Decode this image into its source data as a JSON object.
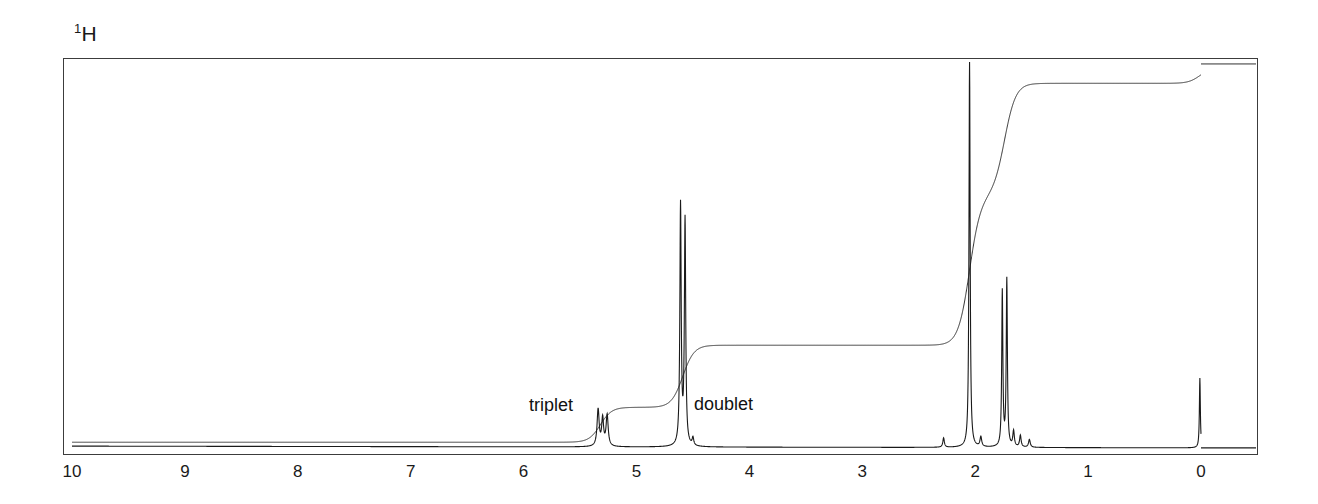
{
  "figure": {
    "nucleus_superscript": "1",
    "nucleus_symbol": "H"
  },
  "annotations": [
    {
      "name": "triplet",
      "label": "triplet",
      "ppm": 5.3
    },
    {
      "name": "doublet",
      "label": "doublet",
      "ppm": 4.6
    }
  ],
  "axis": {
    "label": "",
    "tick_labels": [
      "10",
      "9",
      "8",
      "7",
      "6",
      "5",
      "4",
      "3",
      "2",
      "1",
      "0"
    ],
    "min": 0,
    "max": 10,
    "direction": "reversed"
  },
  "colors": {
    "trace": "#1a1a1a",
    "frame": "#3c3c3c",
    "background": "#ffffff",
    "text": "#1a1a1a"
  },
  "chart_data": {
    "type": "line",
    "title": "1H",
    "xlabel": "",
    "ylabel": "",
    "xlim": [
      10,
      0
    ],
    "ylim": [
      0,
      100
    ],
    "grid": false,
    "legend": "none",
    "tick_values": [
      10,
      9,
      8,
      7,
      6,
      5,
      4,
      3,
      2,
      1,
      0
    ],
    "tick_labels": [
      "10",
      "9",
      "8",
      "7",
      "6",
      "5",
      "4",
      "3",
      "2",
      "1",
      "0"
    ],
    "series": [
      {
        "name": "spectrum",
        "type": "peaks",
        "peaks": [
          {
            "ppm": 5.34,
            "height": 9.5,
            "width": 0.022,
            "multiplicity": "triplet",
            "label": "triplet"
          },
          {
            "ppm": 5.3,
            "height": 7.0,
            "width": 0.02,
            "multiplicity": "triplet"
          },
          {
            "ppm": 5.26,
            "height": 8.0,
            "width": 0.022,
            "multiplicity": "triplet"
          },
          {
            "ppm": 4.61,
            "height": 62.0,
            "width": 0.014,
            "multiplicity": "doublet",
            "label": "doublet"
          },
          {
            "ppm": 4.57,
            "height": 58.0,
            "width": 0.014,
            "multiplicity": "doublet"
          },
          {
            "ppm": 4.5,
            "height": 2.0,
            "width": 0.016
          },
          {
            "ppm": 2.28,
            "height": 2.4,
            "width": 0.016
          },
          {
            "ppm": 2.05,
            "height": 100.0,
            "width": 0.012,
            "multiplicity": "singlet"
          },
          {
            "ppm": 1.95,
            "height": 2.5,
            "width": 0.018
          },
          {
            "ppm": 1.76,
            "height": 40.0,
            "width": 0.012
          },
          {
            "ppm": 1.72,
            "height": 43.0,
            "width": 0.012
          },
          {
            "ppm": 1.66,
            "height": 4.0,
            "width": 0.016
          },
          {
            "ppm": 1.6,
            "height": 3.0,
            "width": 0.016
          },
          {
            "ppm": 1.52,
            "height": 2.0,
            "width": 0.018
          },
          {
            "ppm": 0.01,
            "height": 18.0,
            "width": 0.01,
            "multiplicity": "singlet"
          }
        ]
      },
      {
        "name": "integral",
        "type": "step-trace",
        "steps": [
          {
            "ppm": 10.0,
            "level": 2.0
          },
          {
            "ppm": 5.32,
            "level": 2.0,
            "rise_to": 11.0
          },
          {
            "ppm": 4.59,
            "level": 11.0,
            "rise_to": 27.0
          },
          {
            "ppm": 2.05,
            "level": 27.5,
            "rise_to": 66.0
          },
          {
            "ppm": 1.74,
            "level": 66.0,
            "rise_to": 95.0
          },
          {
            "ppm": 0.01,
            "level": 95.0,
            "rise_to": 99.0
          },
          {
            "ppm": 0.0,
            "level": 99.0
          }
        ]
      }
    ]
  }
}
